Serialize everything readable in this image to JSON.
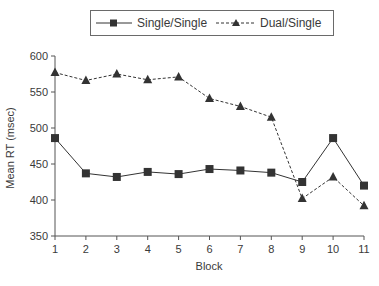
{
  "chart_data": {
    "type": "line",
    "title": "",
    "xlabel": "Block",
    "ylabel": "Mean RT (msec)",
    "x": [
      1,
      2,
      3,
      4,
      5,
      6,
      7,
      8,
      9,
      10,
      11
    ],
    "xticks": [
      "1",
      "2",
      "3",
      "4",
      "5",
      "6",
      "7",
      "8",
      "9",
      "10",
      "11"
    ],
    "yticks": [
      "350",
      "400",
      "450",
      "500",
      "550",
      "600"
    ],
    "ylim": [
      350,
      600
    ],
    "grid": false,
    "legend_position": "top",
    "series": [
      {
        "name": "Single/Single",
        "line_style": "solid",
        "marker": "square",
        "color": "#333333",
        "values": [
          486,
          437,
          432,
          439,
          436,
          443,
          441,
          438,
          425,
          486,
          420
        ]
      },
      {
        "name": "Dual/Single",
        "line_style": "dashed",
        "marker": "triangle",
        "color": "#333333",
        "values": [
          577,
          566,
          575,
          567,
          571,
          541,
          530,
          515,
          402,
          432,
          392
        ]
      }
    ]
  },
  "legend": {
    "items": [
      {
        "label": "Single/Single"
      },
      {
        "label": "Dual/Single"
      }
    ]
  },
  "axes": {
    "x_title": "Block",
    "y_title": "Mean RT (msec)"
  }
}
